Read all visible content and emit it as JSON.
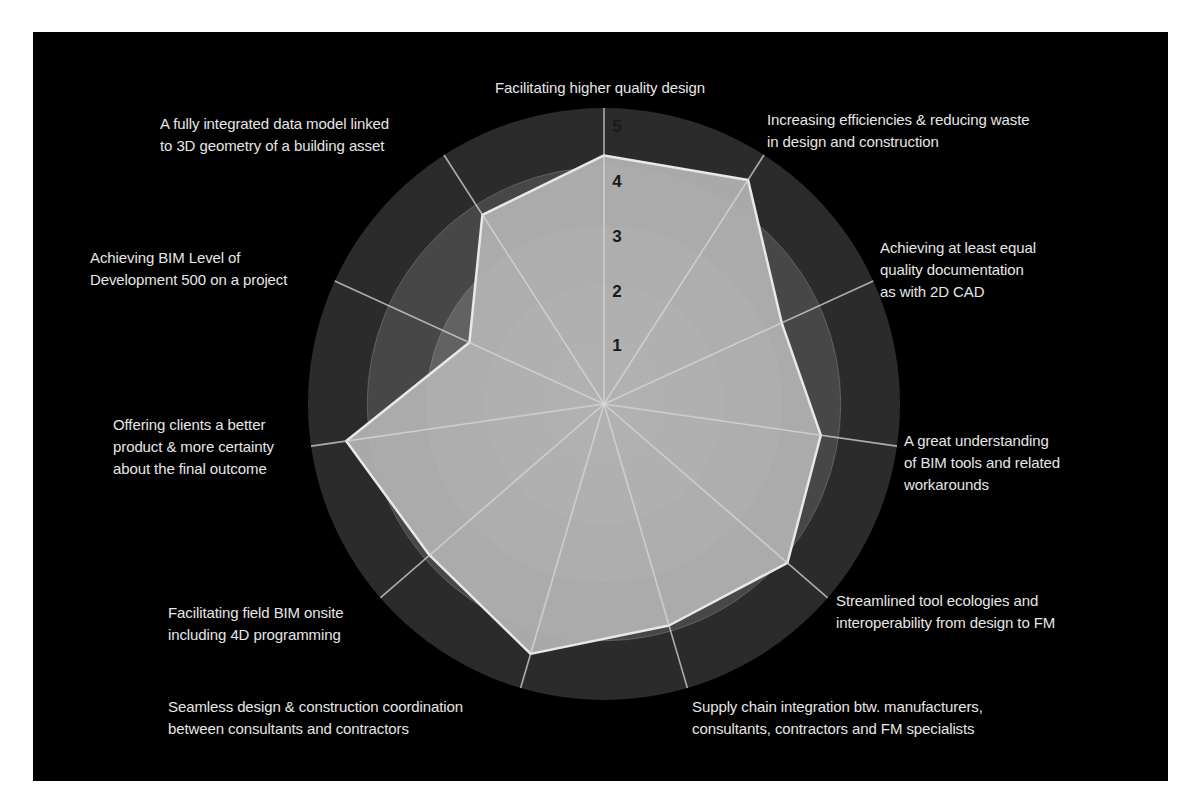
{
  "chart_data": {
    "type": "radar",
    "title": "",
    "scale": {
      "min": 0,
      "max": 5,
      "ticks": [
        1,
        2,
        3,
        4,
        5
      ]
    },
    "grid": true,
    "legend": null,
    "axes": [
      {
        "label": "Facilitating higher quality design",
        "lines": [
          "Facilitating higher quality design"
        ],
        "value": 4.2
      },
      {
        "label": "Increasing efficiencies & reducing waste in design and construction",
        "lines": [
          "Increasing efficiencies & reducing waste",
          "in design and construction"
        ],
        "value": 4.5
      },
      {
        "label": "Achieving at least equal quality documentation as with 2D CAD",
        "lines": [
          "Achieving at least equal",
          "quality documentation",
          "as with 2D CAD"
        ],
        "value": 3.3
      },
      {
        "label": "A great understanding of BIM tools and related workarounds",
        "lines": [
          "A great understanding",
          "of BIM tools and related",
          "workarounds"
        ],
        "value": 3.7
      },
      {
        "label": "Streamlined tool ecologies and interoperability from design to FM",
        "lines": [
          "Streamlined tool ecologies and",
          "interoperability from design to FM"
        ],
        "value": 4.1
      },
      {
        "label": "Supply chain integration btw. manufacturers, consultants, contractors and FM specialists",
        "lines": [
          "Supply chain integration btw. manufacturers,",
          "consultants, contractors and FM specialists"
        ],
        "value": 3.9
      },
      {
        "label": "Seamless design & construction coordination between consultants and contractors",
        "lines": [
          "Seamless design & construction coordination",
          "between consultants and contractors"
        ],
        "value": 4.4
      },
      {
        "label": "Facilitating field BIM onsite including 4D programming",
        "lines": [
          "Facilitating field BIM onsite",
          "including 4D programming"
        ],
        "value": 3.9
      },
      {
        "label": "Offering clients a better product & more certainty about the final outcome",
        "lines": [
          "Offering clients a better",
          "product & more certainty",
          "about the final outcome"
        ],
        "value": 4.4
      },
      {
        "label": "Achieving BIM Level of Development 500 on a project",
        "lines": [
          "Achieving BIM Level of",
          "Development 500 on a project"
        ],
        "value": 2.5
      },
      {
        "label": "A fully integrated data model linked to 3D geometry of a building asset",
        "lines": [
          "A fully integrated data model linked",
          "to 3D geometry of a building asset"
        ],
        "value": 3.8
      }
    ],
    "colors": {
      "background": "#000000",
      "band_outer": "#2b2b2b",
      "band_4": "#474747",
      "band_3": "#626262",
      "band_2": "#7a7a7a",
      "band_1": "#8e8e8e",
      "polygon_fill": "#b4b4b4",
      "polygon_stroke": "#e8e8e8",
      "spoke": "#d8d8d8",
      "label_text": "#e6e6e6",
      "tick_text": "#1a1a1a"
    }
  }
}
